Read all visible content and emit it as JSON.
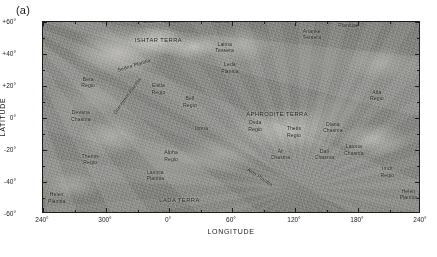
{
  "figure": {
    "panel_label": "(a)",
    "background_color": "#ffffff",
    "frame_color": "#1c1c1c"
  },
  "axes": {
    "x_title": "LONGITUDE",
    "y_title": "LATITUDE",
    "x_ticks": [
      {
        "label": "240°",
        "value": 240
      },
      {
        "label": "300°",
        "value": 300
      },
      {
        "label": "0°",
        "value": 360
      },
      {
        "label": "60°",
        "value": 420
      },
      {
        "label": "120°",
        "value": 480
      },
      {
        "label": "180°",
        "value": 540
      },
      {
        "label": "240°",
        "value": 600
      }
    ],
    "y_ticks": [
      {
        "label": "+60°",
        "value": 60
      },
      {
        "label": "+40°",
        "value": 40
      },
      {
        "label": "+20°",
        "value": 20
      },
      {
        "label": "0°",
        "value": 0
      },
      {
        "label": "-20°",
        "value": -20
      },
      {
        "label": "-40°",
        "value": -40
      },
      {
        "label": "-60°",
        "value": -60
      }
    ],
    "x_range": [
      240,
      600
    ],
    "y_range": [
      -60,
      60
    ]
  },
  "map": {
    "body": "Venus",
    "features": [
      {
        "name": "Lakshmi Planum",
        "text": "Lakshmi\nPlanum",
        "lon": 340,
        "lat": 62,
        "style": "regio"
      },
      {
        "name": "Maxwell Montes",
        "text": "Maxwell\nMontes",
        "lon": 3,
        "lat": 62,
        "style": "regio"
      },
      {
        "name": "Fortuna Tessera",
        "text": "Fortuna\nTessera",
        "lon": 48,
        "lat": 62,
        "style": "regio"
      },
      {
        "name": "Tethus Regio",
        "text": "Tethus\nRegio",
        "lon": 120,
        "lat": 63,
        "style": "regio"
      },
      {
        "name": "Atalanta-Vinmara Planitiae",
        "text": "Atalanta-Vinmara\nPlanitiae",
        "lon": 171,
        "lat": 60,
        "style": "regio"
      },
      {
        "name": "Ishtar Terra",
        "text": "ISHTAR TERRA",
        "lon": 350,
        "lat": 48,
        "style": "terra"
      },
      {
        "name": "Laima Tessera",
        "text": "Laima\nTessera",
        "lon": 53,
        "lat": 44,
        "style": "regio"
      },
      {
        "name": "Ananke Tessera",
        "text": "Ananke\nTessera",
        "lon": 136,
        "lat": 52,
        "style": "regio"
      },
      {
        "name": "Sedna Planitia",
        "text": "Sedna Planitia",
        "lon": 327,
        "lat": 33,
        "style": "rot-ang",
        "rotate": -17
      },
      {
        "name": "Leda Planitia",
        "text": "Leda\nPlanitia",
        "lon": 58,
        "lat": 31,
        "style": "regio"
      },
      {
        "name": "Beta Regio",
        "text": "Beta\nRegio",
        "lon": 283,
        "lat": 22,
        "style": "regio"
      },
      {
        "name": "Eistla Regio",
        "text": "Eistla\nRegio",
        "lon": 350,
        "lat": 18,
        "style": "regio"
      },
      {
        "name": "Guinevere Planitia",
        "text": "Guinevere Planitia",
        "lon": 320,
        "lat": 14,
        "style": "rot-ang",
        "rotate": -54
      },
      {
        "name": "Atla Regio",
        "text": "Atla\nRegio",
        "lon": 198,
        "lat": 14,
        "style": "regio"
      },
      {
        "name": "Bell Regio",
        "text": "Bell\nRegio",
        "lon": 20,
        "lat": 10,
        "style": "regio"
      },
      {
        "name": "Devana Chasma",
        "text": "Devana\nChasma",
        "lon": 276,
        "lat": 1,
        "style": "regio"
      },
      {
        "name": "Aphrodite Terra",
        "text": "APHRODITE TERRA",
        "lon": 103,
        "lat": 2,
        "style": "terra"
      },
      {
        "name": "Ovda Regio",
        "text": "Ovda\nRegio",
        "lon": 82,
        "lat": -5,
        "style": "regio"
      },
      {
        "name": "Ionna",
        "text": "Ionna",
        "lon": 31,
        "lat": -6,
        "style": "regio"
      },
      {
        "name": "Diana Chasma",
        "text": "Diana\nChasma",
        "lon": 156,
        "lat": -6,
        "style": "regio"
      },
      {
        "name": "Thetis Regio",
        "text": "Thetis\nRegio",
        "lon": 119,
        "lat": -9,
        "style": "regio"
      },
      {
        "name": "Alpha Regio",
        "text": "Alpha\nRegio",
        "lon": 2,
        "lat": -24,
        "style": "regio"
      },
      {
        "name": "Themis Regio",
        "text": "Themis\nRegio",
        "lon": 285,
        "lat": -26,
        "style": "regio"
      },
      {
        "name": "Artemis Chasma",
        "text": "Ar\nChasma",
        "lon": 106,
        "lat": -23,
        "style": "regio"
      },
      {
        "name": "Dali Chasma",
        "text": "Dali\nChasma",
        "lon": 148,
        "lat": -23,
        "style": "regio"
      },
      {
        "name": "Latona Chasma",
        "text": "Latona\nChasma",
        "lon": 176,
        "lat": -20,
        "style": "regio"
      },
      {
        "name": "Lavinia Planitia",
        "text": "Lavinia\nPlanitia",
        "lon": 347,
        "lat": -36,
        "style": "regio"
      },
      {
        "name": "Aino Planitia",
        "text": "Aino Planitia",
        "lon": 87,
        "lat": -37,
        "style": "rot-ang",
        "rotate": 33
      },
      {
        "name": "Imdr Regio",
        "text": "Imdr\nRegio",
        "lon": 208,
        "lat": -34,
        "style": "regio"
      },
      {
        "name": "Lada Terra",
        "text": "LADA TERRA",
        "lon": 10,
        "lat": -52,
        "style": "terra"
      },
      {
        "name": "Helen Planitia West",
        "text": "Helen\nPlanitia",
        "lon": 253,
        "lat": -50,
        "style": "regio"
      },
      {
        "name": "Helen Planitia East",
        "text": "Helen\nPlanitia",
        "lon": 228,
        "lat": -48,
        "style": "regio"
      }
    ]
  }
}
